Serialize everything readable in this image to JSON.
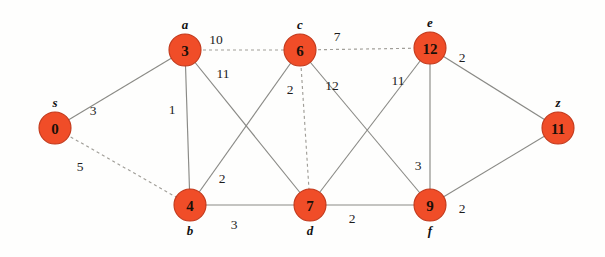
{
  "diagram": {
    "colors": {
      "node_fill": "#f04d28",
      "node_stroke": "#c2381a",
      "edge": "#8a8a86",
      "dashed_edge": "#a09e98",
      "background": "#fefefd",
      "label_text": "#111111"
    },
    "nodes": [
      {
        "id": "s",
        "name": "s",
        "value": "0",
        "x": 55,
        "y": 128,
        "r": 16,
        "label_dx": 0,
        "label_dy": -21
      },
      {
        "id": "a",
        "name": "a",
        "value": "3",
        "x": 185,
        "y": 50,
        "r": 16,
        "label_dx": 0,
        "label_dy": -21
      },
      {
        "id": "b",
        "name": "b",
        "value": "4",
        "x": 190,
        "y": 205,
        "r": 16,
        "label_dx": 0,
        "label_dy": 30
      },
      {
        "id": "c",
        "name": "c",
        "value": "6",
        "x": 300,
        "y": 50,
        "r": 16,
        "label_dx": 0,
        "label_dy": -21
      },
      {
        "id": "d",
        "name": "d",
        "value": "7",
        "x": 310,
        "y": 205,
        "r": 16,
        "label_dx": 0,
        "label_dy": 30
      },
      {
        "id": "e",
        "name": "e",
        "value": "12",
        "x": 430,
        "y": 48,
        "r": 16,
        "label_dx": 0,
        "label_dy": -21
      },
      {
        "id": "f",
        "name": "f",
        "value": "9",
        "x": 430,
        "y": 205,
        "r": 16,
        "label_dx": 0,
        "label_dy": 30
      },
      {
        "id": "z",
        "name": "z",
        "value": "11",
        "x": 558,
        "y": 128,
        "r": 16,
        "label_dx": 0,
        "label_dy": -21
      }
    ],
    "edges": [
      {
        "from": "s",
        "to": "a",
        "weight": "3",
        "style": "solid",
        "label_x": 93,
        "label_y": 110
      },
      {
        "from": "s",
        "to": "b",
        "weight": "5",
        "style": "dashed",
        "label_x": 80,
        "label_y": 166
      },
      {
        "from": "a",
        "to": "c",
        "weight": "10",
        "style": "dashed",
        "label_x": 216,
        "label_y": 39
      },
      {
        "from": "a",
        "to": "b",
        "weight": "1",
        "style": "solid",
        "label_x": 172,
        "label_y": 109
      },
      {
        "from": "a",
        "to": "d",
        "weight": "11",
        "style": "solid",
        "label_x": 223,
        "label_y": 73
      },
      {
        "from": "b",
        "to": "c",
        "weight": "2",
        "style": "solid",
        "label_x": 222,
        "label_y": 178
      },
      {
        "from": "b",
        "to": "d",
        "weight": "3",
        "style": "solid",
        "label_x": 234,
        "label_y": 224
      },
      {
        "from": "c",
        "to": "d",
        "weight": "2",
        "style": "dashed",
        "label_x": 290,
        "label_y": 89
      },
      {
        "from": "c",
        "to": "e",
        "weight": "7",
        "style": "dashed",
        "label_x": 337,
        "label_y": 36
      },
      {
        "from": "c",
        "to": "f",
        "weight": "12",
        "style": "solid",
        "label_x": 332,
        "label_y": 85
      },
      {
        "from": "d",
        "to": "e",
        "weight": "11",
        "style": "solid",
        "label_x": 398,
        "label_y": 80
      },
      {
        "from": "d",
        "to": "f",
        "weight": "2",
        "style": "solid",
        "label_x": 352,
        "label_y": 218
      },
      {
        "from": "e",
        "to": "f",
        "weight": "3",
        "style": "solid",
        "label_x": 418,
        "label_y": 165
      },
      {
        "from": "e",
        "to": "z",
        "weight": "2",
        "style": "solid",
        "label_x": 462,
        "label_y": 57
      },
      {
        "from": "f",
        "to": "z",
        "weight": "2",
        "style": "solid",
        "label_x": 462,
        "label_y": 208
      }
    ]
  }
}
